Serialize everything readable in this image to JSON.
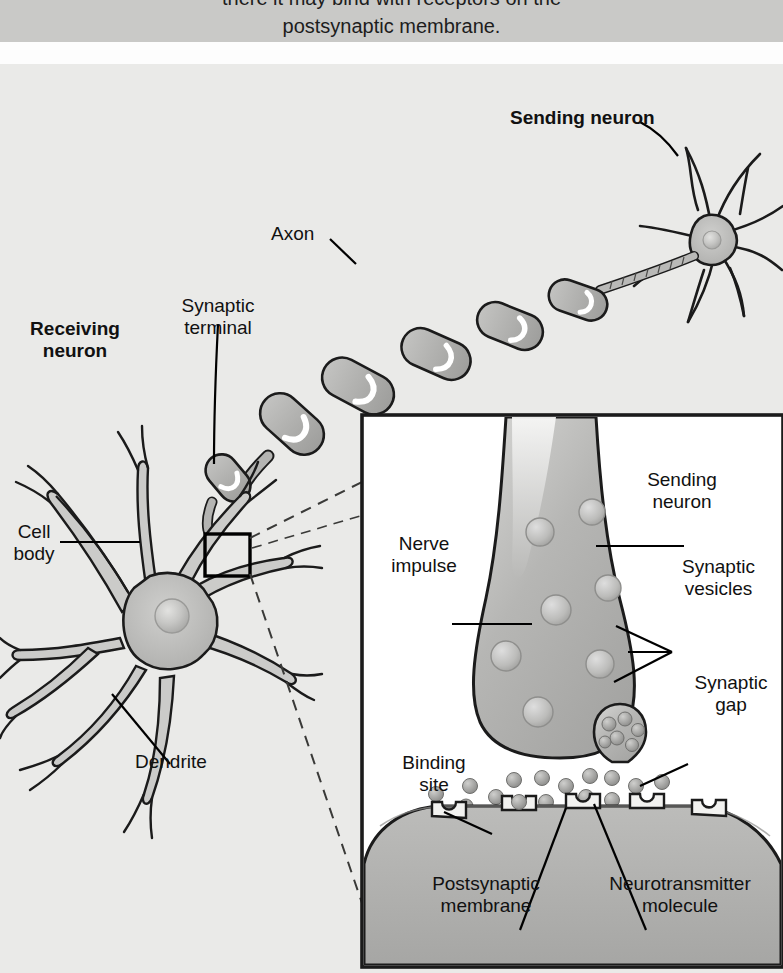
{
  "caption": {
    "line1": "there it may bind with receptors on the",
    "line2": "postsynaptic membrane."
  },
  "figure": {
    "colors": {
      "background": "#eaeae8",
      "caption_band": "#c9c9c7",
      "neuron_fill": "#b4b4b2",
      "neuron_fill_light": "#cfcfcd",
      "outline": "#1b1b1b",
      "inset_background": "#ffffff",
      "vesicle_fill": "#c2c2c0"
    }
  },
  "overview_labels": {
    "sending_neuron": "Sending neuron",
    "receiving_neuron": "Receiving\nneuron",
    "axon": "Axon",
    "synaptic_terminal": "Synaptic\nterminal",
    "cell_body": "Cell\nbody",
    "dendrite": "Dendrite"
  },
  "inset_labels": {
    "sending_neuron": "Sending\nneuron",
    "nerve_impulse": "Nerve\nimpulse",
    "synaptic_vesicles": "Synaptic\nvesicles",
    "synaptic_gap": "Synaptic\ngap",
    "binding_site": "Binding\nsite",
    "postsynaptic_membrane": "Postsynaptic\nmembrane",
    "neurotransmitter_molecule": "Neurotransmitter\nmolecule"
  },
  "diagram_elements": {
    "magnifier_box": "magnified-region-box",
    "vesicle_count": 7,
    "neurotransmitter_count": 14,
    "receptor_count": 5,
    "myelin_segments": 5
  }
}
